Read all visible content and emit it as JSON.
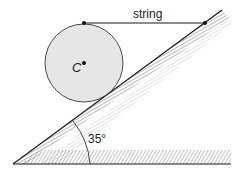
{
  "diagram": {
    "type": "physics-free-body",
    "labels": {
      "string": "string",
      "center": "C",
      "angle": "35°"
    },
    "angle_degrees": 35,
    "colors": {
      "line": "#1a1a1a",
      "cylinder_fill": "#e6e6e6",
      "hatch": "#555555",
      "background": "#ffffff"
    }
  }
}
